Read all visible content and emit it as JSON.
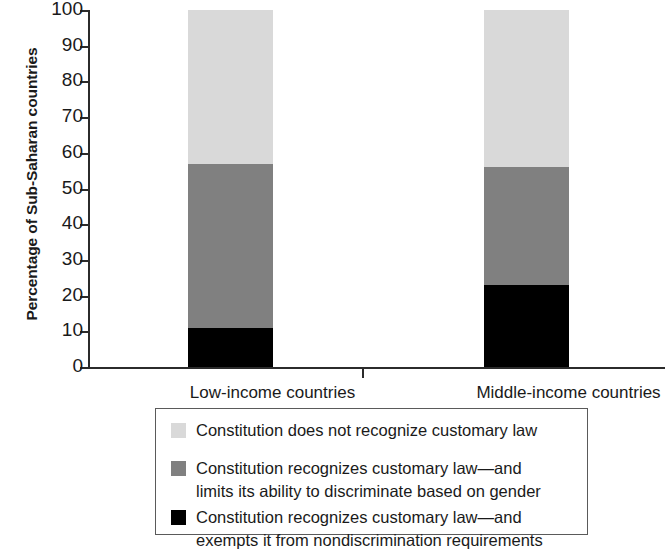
{
  "chart_data": {
    "type": "bar",
    "subtype": "stacked-bar-100",
    "title": "",
    "xlabel": "",
    "ylabel": "Percentage of Sub-Saharan countries",
    "ylim": [
      0,
      100
    ],
    "ytick_labels": [
      "100",
      "90",
      "80",
      "70",
      "60",
      "50",
      "40",
      "30",
      "20",
      "10",
      "0"
    ],
    "ytick_values": [
      100,
      90,
      80,
      70,
      60,
      50,
      40,
      30,
      20,
      10,
      0
    ],
    "grid": false,
    "legend_position": "bottom",
    "categories": [
      "Low-income countries",
      "Middle-income countries"
    ],
    "series": [
      {
        "name": "Constitution does not recognize customary law",
        "color": "#d9d9d9",
        "values": [
          43,
          44
        ]
      },
      {
        "name": "Constitution recognizes customary law—and limits its ability to discriminate based on gender",
        "color": "#808080",
        "values": [
          46,
          33
        ]
      },
      {
        "name": "Constitution recognizes customary law—and exempts it from nondiscrimination requirements",
        "color": "#000000",
        "values": [
          11,
          23
        ]
      }
    ]
  },
  "axis": {
    "y_title": "Percentage of Sub-Saharan countries"
  },
  "legend": {
    "items": [
      {
        "swatch_color": "#d9d9d9",
        "label": "Constitution does not recognize customary law"
      },
      {
        "swatch_color": "#808080",
        "label": "Constitution recognizes customary law—and\nlimits its ability to discriminate based on gender"
      },
      {
        "swatch_color": "#000000",
        "label": "Constitution recognizes customary law—and\nexempts it from nondiscrimination requirements"
      }
    ]
  }
}
